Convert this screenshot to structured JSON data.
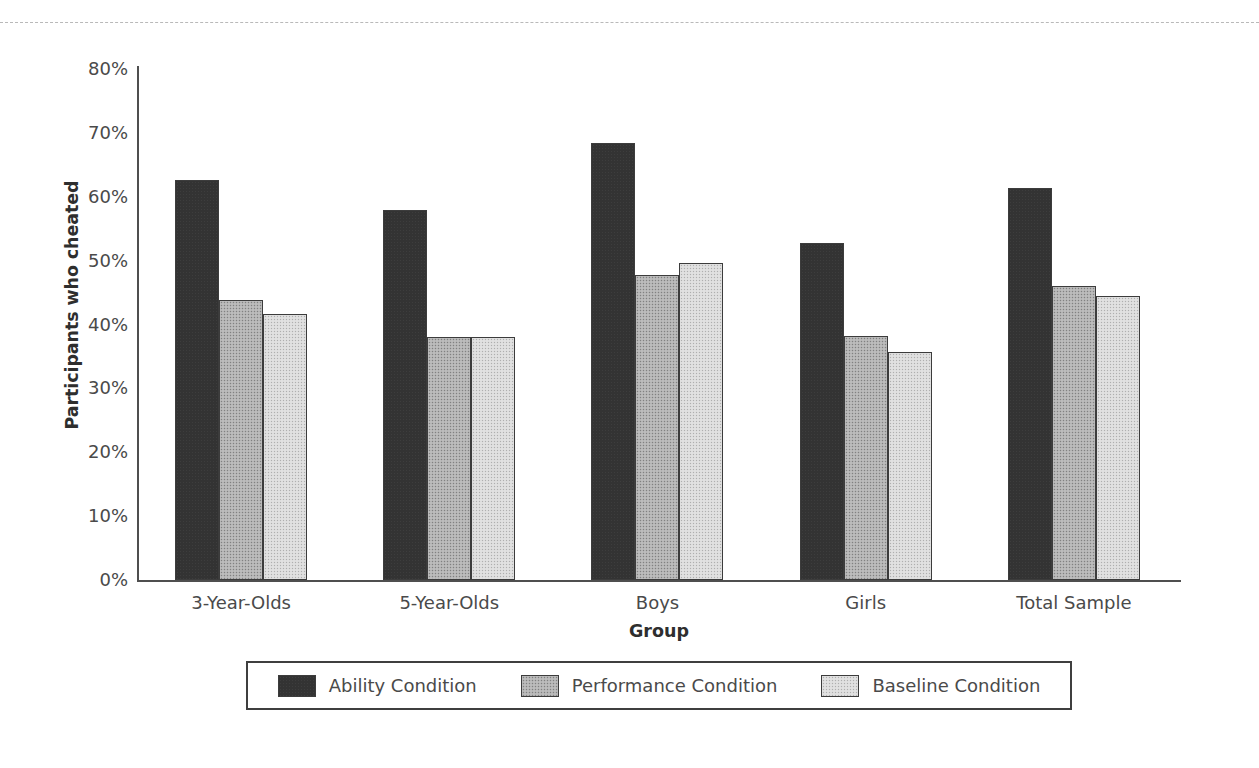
{
  "figure": {
    "top_rule": "dashed-separator"
  },
  "chart_data": {
    "type": "bar",
    "title": "",
    "xlabel": "Group",
    "ylabel": "Participants who cheated",
    "ylim": [
      0,
      80
    ],
    "ytick_labels": [
      "80%",
      "70%",
      "60%",
      "50%",
      "40%",
      "30%",
      "20%",
      "10%",
      "0%"
    ],
    "ytick_values": [
      80,
      70,
      60,
      50,
      40,
      30,
      20,
      10,
      0
    ],
    "grid": false,
    "legend_position": "bottom",
    "categories": [
      "3-Year-Olds",
      "5-Year-Olds",
      "Boys",
      "Girls",
      "Total Sample"
    ],
    "series": [
      {
        "name": "Ability Condition",
        "color": "#333333",
        "values": [
          62.6,
          57.9,
          68.4,
          52.8,
          61.3
        ]
      },
      {
        "name": "Performance Condition",
        "color": "#b2b2b2",
        "values": [
          43.8,
          38.0,
          47.7,
          38.2,
          46.0
        ]
      },
      {
        "name": "Baseline Condition",
        "color": "#dcdcdc",
        "values": [
          41.6,
          38.1,
          49.7,
          35.7,
          44.4
        ]
      }
    ]
  }
}
